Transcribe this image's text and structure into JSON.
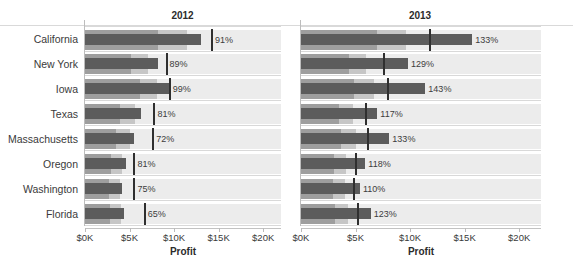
{
  "chart_data": {
    "type": "bar",
    "chart_style": "bullet-chart",
    "title": "",
    "panels": [
      {
        "label": "2012"
      },
      {
        "label": "2013"
      }
    ],
    "categories": [
      "California",
      "New York",
      "Iowa",
      "Texas",
      "Massachusetts",
      "Oregon",
      "Washington",
      "Florida"
    ],
    "xlabel": "Profit",
    "ylabel": "",
    "xlim": [
      0,
      22000
    ],
    "xticks": [
      0,
      5000,
      10000,
      15000,
      20000
    ],
    "xticklabels": [
      "$0K",
      "$5K",
      "$10K",
      "$15K",
      "$20K"
    ],
    "grid": true,
    "legend": "none",
    "series": [
      {
        "name": "2012",
        "panel": "2012",
        "measure_label": "Profit",
        "values": [
          13000,
          8150,
          9400,
          6300,
          5500,
          4550,
          4150,
          4350
        ],
        "reference_values": [
          14250,
          9150,
          9500,
          7800,
          7650,
          5550,
          5550,
          6700
        ],
        "percent_labels": [
          "91%",
          "89%",
          "99%",
          "81%",
          "72%",
          "81%",
          "75%",
          "65%"
        ],
        "bands": [
          {
            "name": "band-1",
            "values": [
              8200,
              5200,
              6200,
              3900,
              3500,
              2900,
              2700,
              2800
            ],
            "color": "#9e9e9e"
          },
          {
            "name": "band-2",
            "values": [
              11500,
              7100,
              8100,
              5600,
              5000,
              4100,
              3900,
              4000
            ],
            "color": "#c6c6c6"
          },
          {
            "name": "band-3",
            "values": [
              22000,
              22000,
              22000,
              22000,
              22000,
              22000,
              22000,
              22000
            ],
            "color": "#ececec"
          }
        ]
      },
      {
        "name": "2013",
        "panel": "2013",
        "measure_label": "Profit",
        "values": [
          15700,
          9800,
          11400,
          7000,
          8100,
          5900,
          5400,
          6400
        ],
        "reference_values": [
          11800,
          7600,
          8000,
          5950,
          6100,
          5000,
          4900,
          5200
        ],
        "percent_labels": [
          "133%",
          "129%",
          "143%",
          "117%",
          "133%",
          "118%",
          "110%",
          "123%"
        ],
        "bands": [
          {
            "name": "band-1",
            "values": [
              7000,
              4400,
              4900,
              3500,
              3700,
              3000,
              2900,
              3100
            ],
            "color": "#9e9e9e"
          },
          {
            "name": "band-2",
            "values": [
              9600,
              6000,
              6700,
              4800,
              5000,
              4100,
              4000,
              4300
            ],
            "color": "#c6c6c6"
          },
          {
            "name": "band-3",
            "values": [
              22000,
              22000,
              22000,
              22000,
              22000,
              22000,
              22000,
              22000
            ],
            "color": "#ececec"
          }
        ]
      }
    ],
    "colors": {
      "measure": "#5c5c5c",
      "reference": "#2f2f2f",
      "band_1": "#9e9e9e",
      "band_2": "#c6c6c6",
      "band_3": "#ececec",
      "gridline": "#d9d9d9",
      "text": "#3a3a3a"
    }
  },
  "axis": {
    "x_title": "Profit",
    "ticklabels": [
      "$0K",
      "$5K",
      "$10K",
      "$15K",
      "$20K"
    ]
  }
}
